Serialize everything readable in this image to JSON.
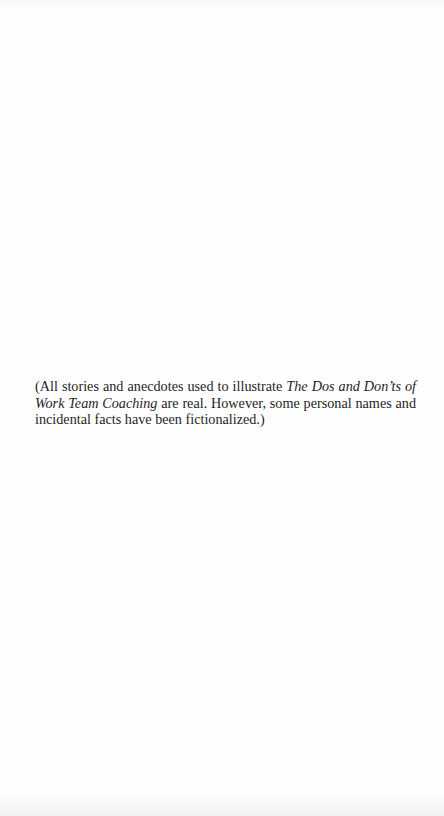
{
  "page": {
    "background_color": "#fefefe",
    "text_color": "#1f1f1f"
  },
  "note": {
    "part1": "(All stories and anecdotes used to illustrate ",
    "book_title": "The Dos and Don’ts of Work Team Coaching",
    "part2": " are real. However, some personal names and incidental facts have been fictionalized.)"
  }
}
